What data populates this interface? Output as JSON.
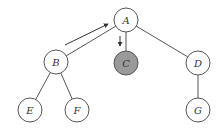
{
  "diagram": {
    "type": "tree",
    "nodes": [
      {
        "id": "A",
        "label": "A",
        "x": 126,
        "y": 20,
        "fill": "#ffffff"
      },
      {
        "id": "B",
        "label": "B",
        "x": 56,
        "y": 62,
        "fill": "#ffffff"
      },
      {
        "id": "C",
        "label": "C",
        "x": 126,
        "y": 63,
        "fill": "#9a9a9a"
      },
      {
        "id": "D",
        "label": "D",
        "x": 198,
        "y": 63,
        "fill": "#ffffff"
      },
      {
        "id": "E",
        "label": "E",
        "x": 30,
        "y": 110,
        "fill": "#ffffff"
      },
      {
        "id": "F",
        "label": "F",
        "x": 77,
        "y": 110,
        "fill": "#ffffff"
      },
      {
        "id": "G",
        "label": "G",
        "x": 198,
        "y": 110,
        "fill": "#ffffff"
      }
    ],
    "edges": [
      {
        "from": "A",
        "to": "B"
      },
      {
        "from": "A",
        "to": "C"
      },
      {
        "from": "A",
        "to": "D"
      },
      {
        "from": "B",
        "to": "E"
      },
      {
        "from": "B",
        "to": "F"
      },
      {
        "from": "D",
        "to": "G"
      }
    ],
    "arrows": [
      {
        "name": "arrow-b-to-a",
        "x1": 65,
        "y1": 45,
        "x2": 108,
        "y2": 24
      },
      {
        "name": "arrow-a-to-c",
        "x1": 120,
        "y1": 36,
        "x2": 120,
        "y2": 46
      }
    ],
    "node_radius": 12
  }
}
